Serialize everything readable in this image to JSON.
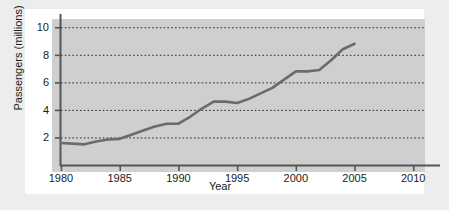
{
  "chart_data": {
    "type": "line",
    "title": "",
    "xlabel": "Year",
    "ylabel": "Passengers (millions)",
    "xlim": [
      1980,
      2011
    ],
    "ylim": [
      0,
      10.6
    ],
    "grid": true,
    "legend": null,
    "xticks": [
      1980,
      1985,
      1990,
      1995,
      2000,
      2005,
      2010
    ],
    "xtick_labels": [
      "1980",
      "1985",
      "1990",
      "1995",
      "2000",
      "2005",
      "2010"
    ],
    "yticks": [
      2,
      4,
      6,
      8,
      10
    ],
    "ytick_labels": [
      "2",
      "4",
      "6",
      "8",
      "10"
    ],
    "series": [
      {
        "name": "Passengers",
        "color": "#6b6b6b",
        "x": [
          1980,
          1981,
          1982,
          1983,
          1984,
          1985,
          1986,
          1987,
          1988,
          1989,
          1990,
          1991,
          1992,
          1993,
          1994,
          1995,
          1996,
          1997,
          1998,
          1999,
          2000,
          2001,
          2002,
          2003,
          2004,
          2005
        ],
        "y": [
          1.6,
          1.55,
          1.5,
          1.7,
          1.85,
          1.9,
          2.2,
          2.5,
          2.8,
          3.0,
          3.0,
          3.5,
          4.1,
          4.6,
          4.6,
          4.5,
          4.8,
          5.2,
          5.6,
          6.2,
          6.8,
          6.8,
          6.9,
          7.6,
          8.4,
          8.8
        ]
      }
    ]
  },
  "axes": {
    "panel_color": "#cfcfcf",
    "axis_color": "#555555",
    "grid_color": "#2a2a2a",
    "frame_color": "#ffffff",
    "figure_color": "#eceded"
  }
}
